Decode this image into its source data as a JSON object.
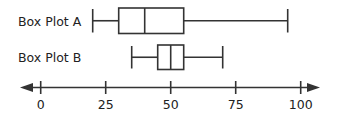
{
  "chart_data": {
    "type": "boxplot",
    "title": "",
    "xlabel": "",
    "ylabel": "",
    "axis": {
      "min": 0,
      "max": 100,
      "ticks": [
        0,
        25,
        50,
        75,
        100
      ],
      "arrows": "both"
    },
    "series": [
      {
        "name": "Box Plot A",
        "min": 20,
        "q1": 30,
        "median": 40,
        "q3": 55,
        "max": 95
      },
      {
        "name": "Box Plot B",
        "min": 35,
        "q1": 45,
        "median": 50,
        "q3": 55,
        "max": 70
      }
    ]
  },
  "labels": {
    "a": "Box Plot A",
    "b": "Box Plot B"
  },
  "ticks": [
    "0",
    "25",
    "50",
    "75",
    "100"
  ],
  "colors": {
    "stroke": "#333333",
    "text": "#222222",
    "background": "#ffffff"
  }
}
